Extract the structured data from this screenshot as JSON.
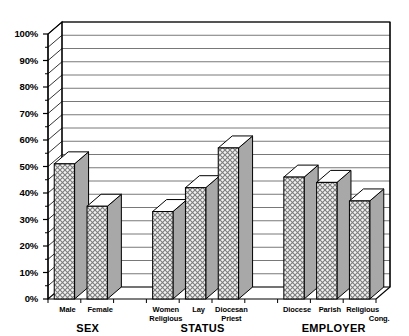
{
  "chart_data": {
    "type": "bar",
    "title": "",
    "subtitle": "",
    "xlabel": "",
    "ylabel": "",
    "ylim": [
      0,
      100
    ],
    "ytick_values": [
      0,
      10,
      20,
      30,
      40,
      50,
      60,
      70,
      80,
      90,
      100
    ],
    "ytick_labels": [
      "0%",
      "10%",
      "20%",
      "30%",
      "40%",
      "50%",
      "60%",
      "70%",
      "80%",
      "90%",
      "100%"
    ],
    "minor_tick_step": 5,
    "gridlines": "horizontal every 5%",
    "grid": true,
    "legend": "none",
    "style": "3d-bar-crosshatch",
    "categories": [
      "Male",
      "Female",
      "Women Religious",
      "Lay",
      "Diocesan Priest",
      "Diocese",
      "Parish",
      "Religious Cong."
    ],
    "values": [
      51,
      35,
      33,
      42,
      57,
      46,
      44,
      37
    ],
    "groups": [
      {
        "label": "SEX",
        "categories": [
          "Male",
          "Female"
        ],
        "values": [
          51,
          35
        ]
      },
      {
        "label": "STATUS",
        "categories": [
          "Women Religious",
          "Lay",
          "Diocesan Priest"
        ],
        "values": [
          33,
          42,
          57
        ]
      },
      {
        "label": "EMPLOYER",
        "categories": [
          "Diocese",
          "Parish",
          "Religious Cong."
        ],
        "values": [
          46,
          44,
          37
        ]
      }
    ]
  },
  "axis": {
    "y_ticks": [
      {
        "label": "100%",
        "value": 100
      },
      {
        "label": "90%",
        "value": 90
      },
      {
        "label": "80%",
        "value": 80
      },
      {
        "label": "70%",
        "value": 70
      },
      {
        "label": "60%",
        "value": 60
      },
      {
        "label": "50%",
        "value": 50
      },
      {
        "label": "40%",
        "value": 40
      },
      {
        "label": "30%",
        "value": 30
      },
      {
        "label": "20%",
        "value": 20
      },
      {
        "label": "10%",
        "value": 10
      },
      {
        "label": "0%",
        "value": 0
      }
    ]
  },
  "x_tick_labels": [
    {
      "line1": "Male",
      "line2": ""
    },
    {
      "line1": "Female",
      "line2": ""
    },
    {
      "line1": "Women",
      "line2": "Religious"
    },
    {
      "line1": "Lay",
      "line2": ""
    },
    {
      "line1": "Diocesan",
      "line2": "Priest"
    },
    {
      "line1": "Diocese",
      "line2": ""
    },
    {
      "line1": "Parish",
      "line2": ""
    },
    {
      "line1": "Religious",
      "line2": "Cong."
    }
  ],
  "group_labels": [
    "SEX",
    "STATUS",
    "EMPLOYER"
  ],
  "colors": {
    "axis": "#000000",
    "grid": "#555555",
    "bar_front": "#e8e8e8",
    "bar_side": "#a8a8a8",
    "bar_top": "#ffffff",
    "background": "#ffffff"
  }
}
